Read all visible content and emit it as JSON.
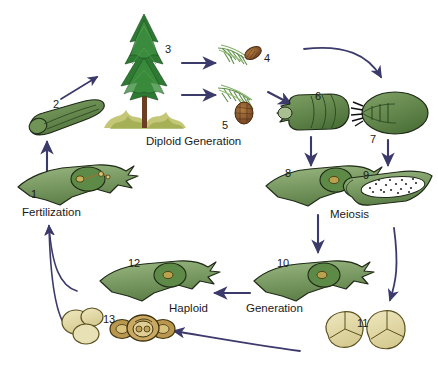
{
  "diagram": {
    "type": "biological-life-cycle",
    "background_color": "#ffffff",
    "arrow_color": "#3c3a6b",
    "palette": {
      "leaf_green_light": "#8fae74",
      "leaf_green_mid": "#6f9456",
      "leaf_green_dark": "#3f6b33",
      "tree_green": "#2f7a34",
      "trunk_brown": "#6b3f22",
      "cone_brown": "#8b5a2b",
      "pollen_tan": "#e4dcae",
      "pollen_outline": "#6b5c22",
      "grass_olive": "#b6bb5c",
      "outline_black": "#1a1a1a"
    }
  },
  "phase_labels": [
    {
      "id": "diploid-generation",
      "text": "Diploid Generation",
      "x": 146,
      "y": 136
    },
    {
      "id": "fertilization",
      "text": "Fertilization",
      "x": 22,
      "y": 207
    },
    {
      "id": "meiosis",
      "text": "Meiosis",
      "x": 330,
      "y": 209
    },
    {
      "id": "haploid",
      "text": "Haploid",
      "x": 169,
      "y": 303
    },
    {
      "id": "generation",
      "text": "Generation",
      "x": 246,
      "y": 303
    }
  ],
  "stages": [
    {
      "number": "1",
      "name": "fertilized-ovule-archegonium",
      "label_x": 31,
      "label_y": 189,
      "caption": "Fertilization within ovule"
    },
    {
      "number": "2",
      "name": "embryo-seedling",
      "label_x": 53,
      "label_y": 99,
      "caption": "Embryo / young sporophyte"
    },
    {
      "number": "3",
      "name": "mature-conifer-tree",
      "label_x": 165,
      "label_y": 44,
      "caption": "Mature sporophyte tree"
    },
    {
      "number": "4",
      "name": "male-pollen-cone-branch",
      "label_x": 264,
      "label_y": 53,
      "caption": "Pollen (male) cone"
    },
    {
      "number": "5",
      "name": "female-seed-cone-branch",
      "label_x": 222,
      "label_y": 120,
      "caption": "Seed (female) cone"
    },
    {
      "number": "6",
      "name": "ovulate-cone-scale",
      "label_x": 315,
      "label_y": 91,
      "caption": "Ovulate cone scale"
    },
    {
      "number": "7",
      "name": "microsporangiate-scale",
      "label_x": 370,
      "label_y": 134,
      "caption": "Microsporangiate scale"
    },
    {
      "number": "8",
      "name": "ovule-megasporocyte",
      "label_x": 285,
      "label_y": 168,
      "caption": "Ovule with megasporocyte"
    },
    {
      "number": "9",
      "name": "microsporangium",
      "label_x": 363,
      "label_y": 170,
      "caption": "Microsporangium with microspores"
    },
    {
      "number": "10",
      "name": "ovule-megaspore",
      "label_x": 277,
      "label_y": 258,
      "caption": "Ovule after meiosis"
    },
    {
      "number": "11",
      "name": "microspores-tetrad",
      "label_x": 357,
      "label_y": 318,
      "caption": "Microspores (tetrad)"
    },
    {
      "number": "12",
      "name": "female-gametophyte",
      "label_x": 128,
      "label_y": 258,
      "caption": "Female gametophyte"
    },
    {
      "number": "13",
      "name": "pollen-grain-germinating",
      "label_x": 103,
      "label_y": 314,
      "caption": "Pollen grain / male gametophyte"
    }
  ],
  "arrows": [
    {
      "id": "arrow-1-to-2",
      "from": "1",
      "to": "2",
      "shape": "straight-up"
    },
    {
      "id": "arrow-2-to-3",
      "from": "2",
      "to": "3",
      "shape": "diagonal-up-right"
    },
    {
      "id": "arrow-3-to-4",
      "from": "3",
      "to": "4",
      "shape": "straight-right"
    },
    {
      "id": "arrow-3-to-5",
      "from": "3",
      "to": "5",
      "shape": "straight-right"
    },
    {
      "id": "arrow-5-to-6",
      "from": "5",
      "to": "6",
      "shape": "diagonal-down-right"
    },
    {
      "id": "arrow-4-to-7",
      "from": "4",
      "to": "7",
      "shape": "curve-right-down"
    },
    {
      "id": "arrow-6-to-8",
      "from": "6",
      "to": "8",
      "shape": "straight-down"
    },
    {
      "id": "arrow-7-to-9",
      "from": "7",
      "to": "9",
      "shape": "straight-down"
    },
    {
      "id": "arrow-8-to-10",
      "from": "8",
      "to": "10",
      "shape": "straight-down"
    },
    {
      "id": "arrow-9-to-11",
      "from": "9",
      "to": "11",
      "shape": "curve-down"
    },
    {
      "id": "arrow-10-to-12",
      "from": "10",
      "to": "12",
      "shape": "straight-left"
    },
    {
      "id": "arrow-11-to-13",
      "from": "11",
      "to": "13",
      "shape": "curve-left"
    },
    {
      "id": "arrow-12-to-1",
      "from": "12",
      "to": "1",
      "shape": "curve-up-left"
    },
    {
      "id": "arrow-13-to-1",
      "from": "13",
      "to": "1",
      "shape": "curve-up-left"
    }
  ]
}
